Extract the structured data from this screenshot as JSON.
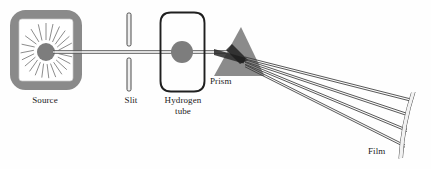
{
  "figure": {
    "background_color": "#fefefe",
    "width": 431,
    "height": 169
  },
  "labels": {
    "source": "Source",
    "slit": "Slit",
    "hydrogen_tube": "Hydrogen\ntube",
    "prism": "Prism",
    "film": "Film"
  },
  "colors": {
    "ink": "#1a1a1a",
    "gray_fill": "#808080",
    "gray_border": "#8a8a8a",
    "prism_fill": "#8b8b8b",
    "prism_shadow": "#2b2b2b",
    "beam": "#555555",
    "ray": "#3a3a3a",
    "starburst": "#6f6f6f"
  },
  "components": {
    "source": {
      "name": "Source",
      "shape": "rounded-rectangle",
      "x": 10,
      "y": 10,
      "width": 72,
      "height": 80,
      "border_width": 9,
      "corner_radius": 14,
      "emitter": {
        "cx": 46,
        "cy": 52,
        "r": 9,
        "ray_count": 22
      }
    },
    "slit": {
      "name": "Slit",
      "shape": "two-vertical-bars",
      "x": 128,
      "top_bar": {
        "y": 13,
        "height": 33
      },
      "bottom_bar": {
        "y": 58,
        "height": 33
      },
      "bar_width": 4
    },
    "hydrogen_tube": {
      "name": "Hydrogen tube",
      "shape": "rounded-rectangle-outline",
      "x": 160,
      "y": 12,
      "width": 45,
      "height": 80,
      "corner_radius": 11,
      "glow": {
        "cx": 182,
        "cy": 52,
        "r": 11
      }
    },
    "prism": {
      "name": "Prism",
      "shape": "triangle",
      "apex": {
        "x": 241,
        "y": 28
      },
      "base_left": {
        "x": 214,
        "y": 76
      },
      "base_right": {
        "x": 264,
        "y": 76
      }
    },
    "film": {
      "name": "Film",
      "shape": "curved-strip",
      "top": {
        "x": 415,
        "y": 92
      },
      "bottom": {
        "x": 403,
        "y": 158
      },
      "thickness": 3
    },
    "beam": {
      "name": "incident beam",
      "from": {
        "x": 52,
        "y": 52
      },
      "to": {
        "x": 238,
        "y": 52
      },
      "style": "double-line"
    },
    "dispersed_rays": {
      "count": 4,
      "origin": {
        "x": 245,
        "y": 55
      },
      "endpoints": [
        {
          "x": 410,
          "y": 100
        },
        {
          "x": 408,
          "y": 115
        },
        {
          "x": 406,
          "y": 131
        },
        {
          "x": 404,
          "y": 147
        }
      ]
    }
  }
}
